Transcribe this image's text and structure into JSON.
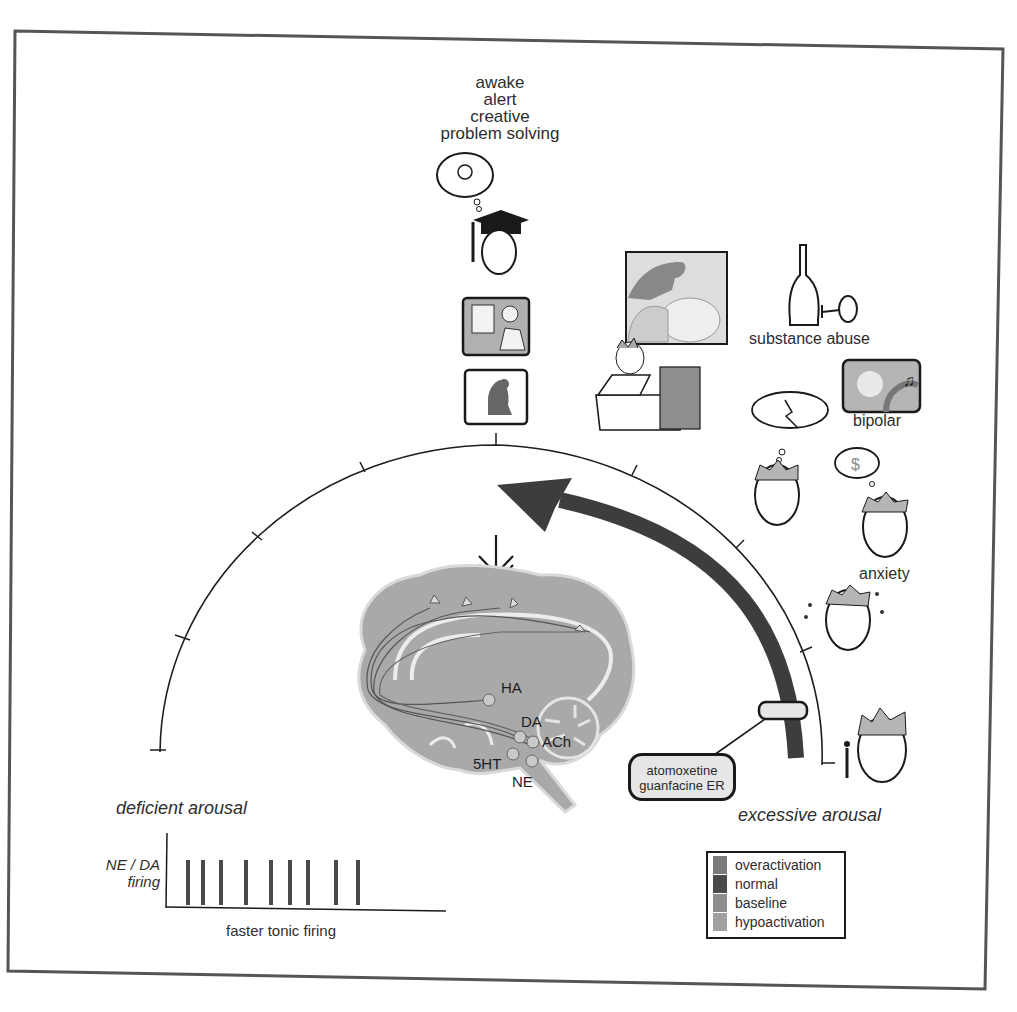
{
  "figure": {
    "type": "arousal-spectrum-diagram",
    "top_states": [
      "awake",
      "alert",
      "creative",
      "problem solving"
    ],
    "left_label": "deficient arousal",
    "right_label": "excessive arousal",
    "conditions": {
      "substance_abuse": "substance abuse",
      "bipolar": "bipolar",
      "anxiety": "anxiety"
    },
    "drug_box": {
      "line1": "atomoxetine",
      "line2": "guanfacine ER"
    },
    "brain": {
      "labels": [
        "HA",
        "DA",
        "ACh",
        "5HT",
        "NE"
      ]
    },
    "firing_plot": {
      "ylabel_line1": "NE / DA",
      "ylabel_line2": "firing",
      "xlabel": "faster tonic firing",
      "spike_positions_px": [
        188,
        203,
        221,
        246,
        271,
        290,
        308,
        336,
        358
      ]
    },
    "legend": {
      "items": [
        {
          "label": "overactivation",
          "color": "#7a7a7a"
        },
        {
          "label": "normal",
          "color": "#4a4a4a"
        },
        {
          "label": "baseline",
          "color": "#8e8e8e"
        },
        {
          "label": "hypoactivation",
          "color": "#a0a0a0"
        }
      ]
    },
    "colors": {
      "arrow": "#3d3d3d",
      "brain_fill": "#a9a9a9",
      "brain_line": "#e8e8e8",
      "frame": "#555555",
      "spike": "#4a4a4a"
    }
  }
}
